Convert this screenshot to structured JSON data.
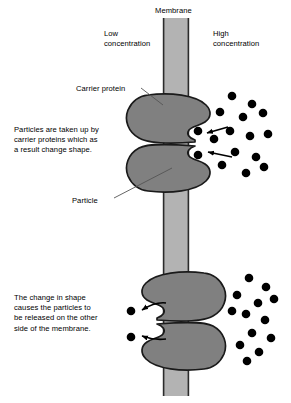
{
  "figure": {
    "caption": ""
  },
  "labels": {
    "membrane": "Membrane",
    "low_concentration": "Low\nconcentration",
    "high_concentration": "High\nconcentration",
    "carrier_protein": "Carrier protein",
    "particle": "Particle"
  },
  "annotations": {
    "uptake": "Particles are taken up by\ncarrier proteins which as\na result change shape.",
    "release": "The change in shape\ncauses the particles to\nbe released on the other\nside of the membrane."
  },
  "colors": {
    "membrane_fill": "#b3b3b3",
    "membrane_stroke": "#2b2b2b",
    "protein_fill": "#808080",
    "protein_stroke": "#1a1a1a",
    "particle_fill": "#000000",
    "background": "#ffffff",
    "text": "#000000",
    "leader_line": "#555555",
    "arrow": "#000000"
  },
  "diagram": {
    "membrane": {
      "x": 163,
      "y": 18,
      "width": 26,
      "height": 378
    },
    "stages": [
      {
        "name": "uptake-stage",
        "pocket_side": "right",
        "pocket_filled": true,
        "arrow_style": "straight",
        "arrow_direction": "inward-left",
        "particles_in_pocket": 2,
        "arrows": 2
      },
      {
        "name": "release-stage",
        "pocket_side": "left",
        "pocket_filled": false,
        "arrow_style": "curved",
        "arrow_direction": "outward-left",
        "particles_released": 2,
        "arrows": 2
      }
    ],
    "particle_radius": 4.3,
    "particle_cloud_upper": [
      [
        232,
        96
      ],
      [
        252,
        104
      ],
      [
        220,
        112
      ],
      [
        243,
        117
      ],
      [
        263,
        113
      ],
      [
        230,
        131
      ],
      [
        250,
        136
      ],
      [
        214,
        139
      ],
      [
        268,
        134
      ],
      [
        235,
        152
      ],
      [
        256,
        157
      ],
      [
        222,
        165
      ],
      [
        246,
        173
      ],
      [
        264,
        167
      ]
    ],
    "particle_cloud_lower": [
      [
        249,
        278
      ],
      [
        266,
        287
      ],
      [
        237,
        295
      ],
      [
        258,
        303
      ],
      [
        274,
        299
      ],
      [
        246,
        314
      ],
      [
        265,
        320
      ],
      [
        232,
        311
      ],
      [
        252,
        333
      ],
      [
        271,
        338
      ],
      [
        240,
        345
      ],
      [
        259,
        352
      ],
      [
        247,
        361
      ]
    ],
    "particles_in_upper_pocket": [
      [
        198,
        131
      ],
      [
        198,
        155
      ]
    ],
    "particles_released_lower": [
      [
        131,
        311
      ],
      [
        131,
        337
      ]
    ]
  }
}
